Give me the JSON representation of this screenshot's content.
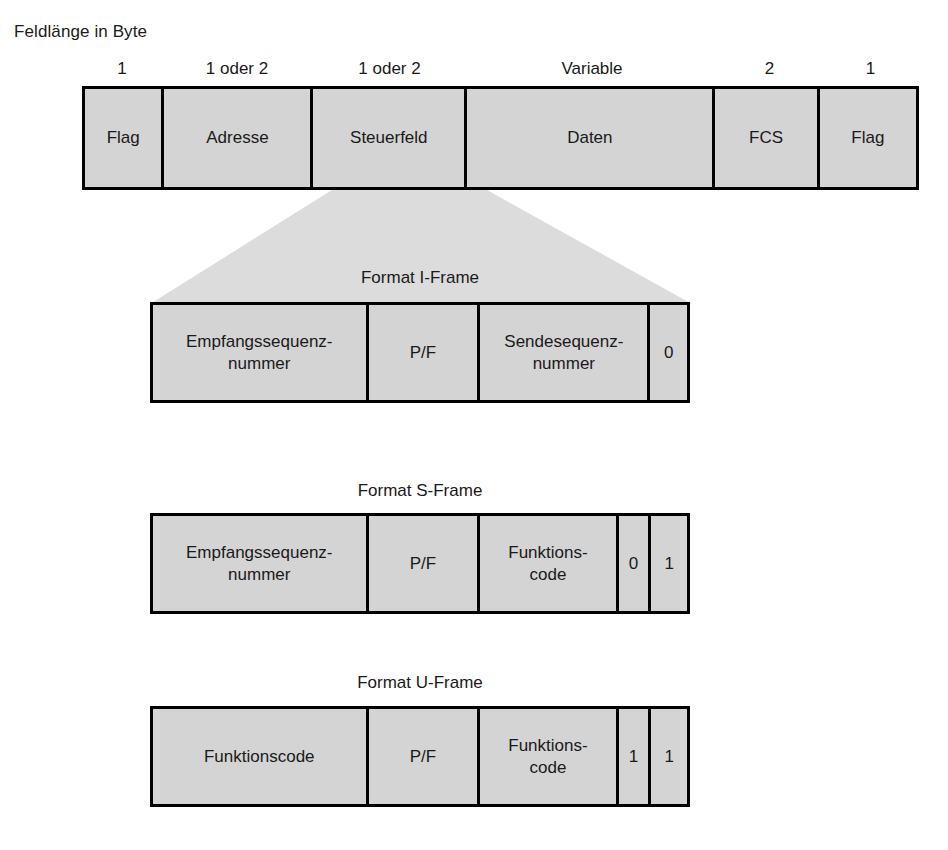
{
  "headline": "Feldlänge in Byte",
  "colors": {
    "cell_fill": "#d4d4d4",
    "border": "#000000",
    "funnel_fill": "#dcdcdc",
    "text": "#1a1a1a"
  },
  "top_frame": {
    "name": "HDLC-Rahmen",
    "size_labels": [
      "1",
      "1 oder 2",
      "1 oder 2",
      "Variable",
      "2",
      "1"
    ],
    "cells": [
      {
        "label": "Flag",
        "size": "1"
      },
      {
        "label": "Adresse",
        "size": "1 oder 2"
      },
      {
        "label": "Steuerfeld",
        "size": "1 oder 2"
      },
      {
        "label": "Daten",
        "size": "Variable"
      },
      {
        "label": "FCS",
        "size": "2"
      },
      {
        "label": "Flag",
        "size": "1"
      }
    ]
  },
  "subframes": [
    {
      "caption": "Format I-Frame",
      "cells": [
        {
          "label": "Empfangssequenz-\nnummer"
        },
        {
          "label": "P/F"
        },
        {
          "label": "Sendesequenz-\nnummer"
        },
        {
          "label": "0"
        }
      ]
    },
    {
      "caption": "Format S-Frame",
      "cells": [
        {
          "label": "Empfangssequenz-\nnummer"
        },
        {
          "label": "P/F"
        },
        {
          "label": "Funktions-\ncode"
        },
        {
          "label": "0"
        },
        {
          "label": "1"
        }
      ]
    },
    {
      "caption": "Format U-Frame",
      "cells": [
        {
          "label": "Funktionscode"
        },
        {
          "label": "P/F"
        },
        {
          "label": "Funktions-\ncode"
        },
        {
          "label": "1"
        },
        {
          "label": "1"
        }
      ]
    }
  ]
}
